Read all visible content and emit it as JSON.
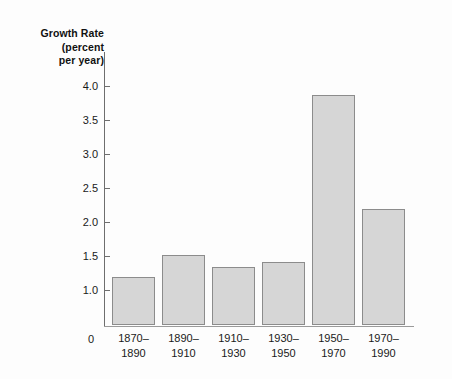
{
  "chart_data": {
    "type": "bar",
    "title": "Growth Rate (percent per year)",
    "title_lines": [
      "Growth Rate",
      "(percent",
      "per year)"
    ],
    "xlabel": "",
    "ylabel": "Growth Rate (percent per year)",
    "categories": [
      "1870–1890",
      "1890–1910",
      "1910–1930",
      "1930–1950",
      "1950–1970",
      "1970–1990"
    ],
    "category_lines": [
      [
        "1870–",
        "1890"
      ],
      [
        "1890–",
        "1910"
      ],
      [
        "1910–",
        "1930"
      ],
      [
        "1930–",
        "1950"
      ],
      [
        "1950–",
        "1970"
      ],
      [
        "1970–",
        "1990"
      ]
    ],
    "values": [
      1.18,
      1.5,
      1.32,
      1.4,
      3.85,
      2.17
    ],
    "ylim": [
      0,
      4.2
    ],
    "yticks": [
      1.0,
      1.5,
      2.0,
      2.5,
      3.0,
      3.5,
      4.0
    ],
    "ytick_labels": [
      "1.0",
      "1.5",
      "2.0",
      "2.5",
      "3.0",
      "3.5",
      "4.0"
    ],
    "zero_label": "0",
    "grid": false,
    "legend": false,
    "bar_fill_color": "#d6d6d6",
    "bar_border_color": "#8c8c8c",
    "axis_color": "#6e6e6e",
    "background_color": "#fdfdfd"
  }
}
